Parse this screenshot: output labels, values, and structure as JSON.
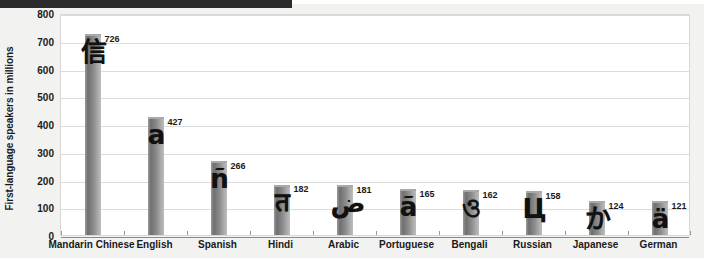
{
  "window": {
    "title_strip_text": ""
  },
  "chart_data": {
    "type": "bar",
    "title": "",
    "xlabel": "",
    "ylabel": "First-language speakers in millions",
    "ylim": [
      0,
      800
    ],
    "yticks": [
      0,
      100,
      200,
      300,
      400,
      500,
      600,
      700,
      800
    ],
    "ytick_labels": [
      "0",
      "100",
      "200",
      "300",
      "400",
      "500",
      "600",
      "700",
      "800"
    ],
    "grid": true,
    "legend": false,
    "categories": [
      "Mandarin Chinese",
      "English",
      "Spanish",
      "Hindi",
      "Arabic",
      "Portuguese",
      "Bengali",
      "Russian",
      "Japanese",
      "German"
    ],
    "values": [
      726,
      427,
      266,
      182,
      181,
      165,
      162,
      158,
      124,
      121
    ],
    "value_labels": [
      "726",
      "427",
      "266",
      "182",
      "181",
      "165",
      "162",
      "158",
      "124",
      "121"
    ],
    "bar_glyphs": [
      "信",
      "a",
      "ñ",
      "त",
      "ض",
      "ã",
      "ও",
      "Ц",
      "か",
      "ä"
    ],
    "bar_color": "#8d8d8d"
  },
  "colors": {
    "page_background": "#f2f2f0",
    "plot_background": "#ffffff",
    "gridline": "#dcdcdc",
    "axis": "#8a8a8a",
    "text": "#1a1a1a",
    "title_strip": "#2b2b2b"
  }
}
